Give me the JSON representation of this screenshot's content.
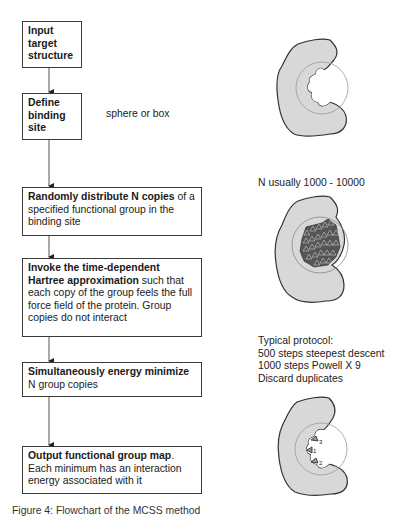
{
  "flowchart": {
    "steps": [
      {
        "bold": "Input target structure",
        "rest": ""
      },
      {
        "bold": "Define binding site",
        "rest": ""
      },
      {
        "bold": "Randomly distribute N copies",
        "rest": " of a specified functional group in the binding site"
      },
      {
        "bold": "Invoke the time-dependent Hartree approximation",
        "rest": " such that each copy of the group feels the full force field of the protein.  Group copies do not interact"
      },
      {
        "bold": "Simultaneously energy minimize",
        "rest": " N group copies"
      },
      {
        "bold": "Output functional group map",
        "rest": ". Each minimum has an interaction energy associated with it"
      }
    ]
  },
  "notes": {
    "binding_site": "sphere or box",
    "n_copies": "N usually 1000 - 10000",
    "protocol_title": "Typical protocol:",
    "protocol_line1": "500 steps steepest descent",
    "protocol_line2": "1000 steps Powell X 9",
    "protocol_line3": "Discard duplicates"
  },
  "figures": {
    "minima_labels": [
      "1",
      "2",
      "3"
    ]
  },
  "caption": "Figure 4: Flowchart of the MCSS method"
}
